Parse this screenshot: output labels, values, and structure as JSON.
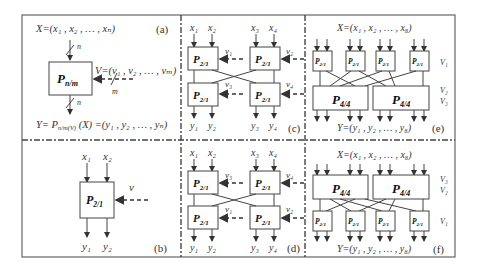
{
  "panels": {
    "a": {
      "label": "(a)",
      "input_set": "X=(x₁ , x₂ , … , xₙ)",
      "block": "P",
      "block_sub": "n/m",
      "in_width": "n",
      "out_width": "n",
      "ctrl_set": "V=(v₁ , v₂ , … , vₘ)",
      "ctrl_width": "m",
      "output_eq": "Y= P",
      "output_eq_sub": "n/m(V)",
      "output_eq_tail": " (X) =(y₁ , y₂ , … , yₙ)"
    },
    "b": {
      "label": "(b)",
      "inputs": [
        "x₁",
        "x₂"
      ],
      "outputs": [
        "y₁",
        "y₂"
      ],
      "ctrl": "v",
      "block": "P",
      "block_sub": "2/1"
    },
    "c": {
      "label": "(c)",
      "inputs": [
        "x₁",
        "x₂",
        "x₃",
        "x₄"
      ],
      "outputs": [
        "y₁",
        "y₂",
        "y₃",
        "y₄"
      ],
      "ctrls": [
        "v₁",
        "v₂",
        "v₃",
        "v₄"
      ],
      "block": "P",
      "block_sub": "2/1"
    },
    "d": {
      "label": "(d)",
      "inputs": [
        "x₁",
        "x₂",
        "x₃",
        "x₄"
      ],
      "outputs": [
        "y₁",
        "y₂",
        "y₃",
        "y₄"
      ],
      "ctrls": [
        "v₃",
        "v₄",
        "v₁",
        "v₂"
      ],
      "block": "P",
      "block_sub": "2/1"
    },
    "e": {
      "label": "(e)",
      "input_set": "X=(x₁ , x₂ , … , x₈)",
      "output_set": "Y=(y₁ , y₂ , … , y₈)",
      "small_block": "P",
      "small_sub": "2/1",
      "big_block": "P",
      "big_sub": "4/4",
      "ctrl_labels": [
        "V₁",
        "V₂",
        "V₃"
      ]
    },
    "f": {
      "label": "(f)",
      "input_set": "X=(x₁ , x₂ , … , x₈)",
      "output_set": "Y=(y₁ , y₂ , … , y₈)",
      "small_block": "P",
      "small_sub": "2/1",
      "big_block": "P",
      "big_sub": "4/4",
      "ctrl_labels": [
        "V₃",
        "V₂",
        "V₁"
      ]
    }
  },
  "colors": {
    "line": "#444444",
    "text": "#333333",
    "background": "#ffffff"
  }
}
